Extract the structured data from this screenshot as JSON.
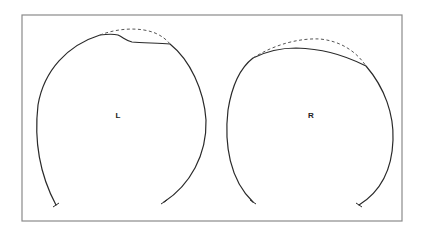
{
  "figure": {
    "panels": [
      {
        "id": "left",
        "label": "L",
        "description": "Head contour with flattened/indented vertex; dashed line shows expected normal curvature"
      },
      {
        "id": "right",
        "label": "R",
        "description": "Head contour with flattened vertex; dashed line shows expected normal curvature"
      }
    ],
    "colors": {
      "line": "#2a2a2a",
      "dashed": "#555555",
      "frame": "#8a8a8a",
      "background": "#ffffff"
    }
  }
}
